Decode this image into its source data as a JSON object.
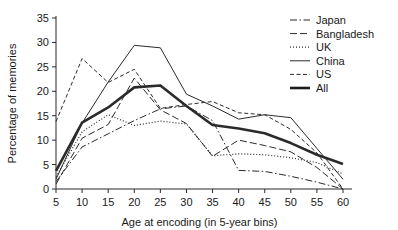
{
  "chart_data": {
    "type": "line",
    "title": "",
    "xlabel": "Age at encoding (in 5-year bins)",
    "ylabel": "Percentage of memories",
    "xlim": [
      5,
      60
    ],
    "ylim": [
      0,
      35
    ],
    "xticks": [
      5,
      10,
      15,
      20,
      25,
      30,
      35,
      40,
      45,
      50,
      55,
      60
    ],
    "yticks": [
      0,
      5,
      10,
      15,
      20,
      25,
      30,
      35
    ],
    "xtick_labels": [
      "5",
      "10",
      "15",
      "20",
      "25",
      "30",
      "35",
      "40",
      "45",
      "50",
      "55",
      "60"
    ],
    "ytick_labels": [
      "0",
      "5",
      "10",
      "15",
      "20",
      "25",
      "30",
      "35"
    ],
    "grid": false,
    "legend_position": "top-right",
    "x": [
      5,
      10,
      15,
      20,
      25,
      30,
      35,
      40,
      45,
      50,
      55,
      60
    ],
    "series": [
      {
        "name": "Japan",
        "style": "dash-dot",
        "width": 1,
        "color": "#2b2b2b",
        "values": [
          1.5,
          8.6,
          11.3,
          14.0,
          16.4,
          17.0,
          14.0,
          3.8,
          3.6,
          2.6,
          1.4,
          0.0
        ]
      },
      {
        "name": "Bangladesh",
        "style": "long-dash",
        "width": 1,
        "color": "#2b2b2b",
        "values": [
          1.0,
          10.4,
          13.2,
          22.7,
          16.2,
          13.4,
          6.7,
          10.0,
          8.9,
          7.6,
          4.4,
          0.0
        ]
      },
      {
        "name": "UK",
        "style": "dotted",
        "width": 1.2,
        "color": "#2b2b2b",
        "values": [
          2.5,
          11.7,
          15.2,
          13.0,
          13.9,
          13.3,
          6.8,
          7.2,
          7.0,
          6.4,
          5.4,
          3.1
        ]
      },
      {
        "name": "China",
        "style": "solid",
        "width": 1,
        "color": "#2b2b2b",
        "values": [
          2.0,
          13.5,
          21.9,
          29.4,
          28.9,
          19.4,
          17.0,
          14.3,
          15.2,
          14.6,
          8.3,
          2.0
        ]
      },
      {
        "name": "US",
        "style": "short-dash",
        "width": 1,
        "color": "#2b2b2b",
        "values": [
          13.8,
          26.7,
          21.8,
          24.5,
          16.5,
          17.3,
          17.9,
          15.6,
          15.2,
          12.2,
          7.4,
          0.0
        ]
      },
      {
        "name": "All",
        "style": "solid",
        "width": 2.6,
        "color": "#1a1a1a",
        "values": [
          3.7,
          13.6,
          16.7,
          20.8,
          21.2,
          17.0,
          13.1,
          12.4,
          11.4,
          9.4,
          7.0,
          5.1
        ]
      }
    ]
  },
  "legend": {
    "entries": [
      {
        "label": "Japan"
      },
      {
        "label": "Bangladesh"
      },
      {
        "label": "UK"
      },
      {
        "label": "China"
      },
      {
        "label": "US"
      },
      {
        "label": "All"
      }
    ]
  }
}
